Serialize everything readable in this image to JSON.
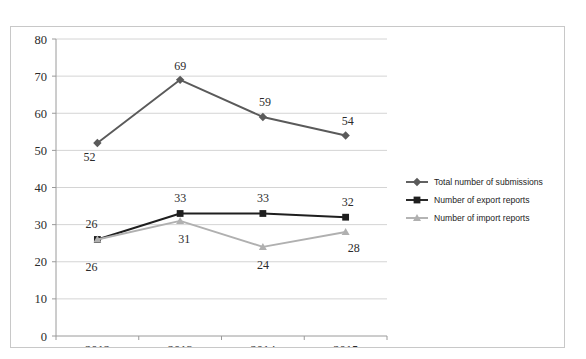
{
  "clipped_text_fragment": "",
  "chart_data": {
    "type": "line",
    "title": "",
    "xlabel": "",
    "ylabel": "",
    "categories": [
      "2012",
      "2013",
      "2014",
      "2015"
    ],
    "ylim": [
      0,
      80
    ],
    "ytick_step": 10,
    "yticks": [
      "0",
      "10",
      "20",
      "30",
      "40",
      "50",
      "60",
      "70",
      "80"
    ],
    "grid": true,
    "legend_position": "right",
    "series": [
      {
        "name": "Total number of submissions",
        "values": [
          52,
          69,
          59,
          54
        ],
        "labels": [
          "52",
          "69",
          "59",
          "54"
        ],
        "color": "#5a5a5a",
        "marker": "diamond"
      },
      {
        "name": "Number of export reports",
        "values": [
          26,
          33,
          33,
          32
        ],
        "labels": [
          "26",
          "33",
          "33",
          "32"
        ],
        "color": "#1f1f1f",
        "marker": "square"
      },
      {
        "name": "Number of import reports",
        "values": [
          26,
          31,
          24,
          28
        ],
        "labels": [
          "26",
          "31",
          "24",
          "28"
        ],
        "color": "#b0b0b0",
        "marker": "triangle"
      }
    ]
  }
}
